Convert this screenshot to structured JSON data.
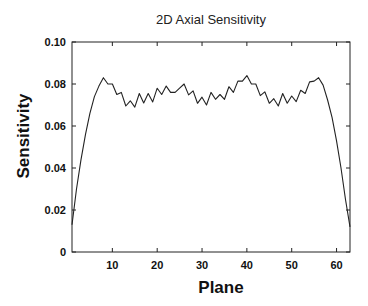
{
  "chart_data": {
    "type": "line",
    "title": "2D Axial Sensitivity",
    "xlabel": "Plane",
    "ylabel": "Sensitivity",
    "xlim": [
      1,
      63
    ],
    "ylim": [
      0,
      0.1
    ],
    "xticks": [
      10,
      20,
      30,
      40,
      50,
      60
    ],
    "xtick_labels": [
      "10",
      "20",
      "30",
      "40",
      "50",
      "60"
    ],
    "yticks": [
      0,
      0.02,
      0.04,
      0.06,
      0.08,
      0.1
    ],
    "ytick_labels": [
      "0",
      "0.02",
      "0.04",
      "0.06",
      "0.08",
      "0.10"
    ],
    "grid": false,
    "legend": null,
    "series": [
      {
        "name": "Sensitivity",
        "color": "#222222",
        "x": [
          1,
          2,
          3,
          4,
          5,
          6,
          7,
          8,
          9,
          10,
          11,
          12,
          13,
          14,
          15,
          16,
          17,
          18,
          19,
          20,
          21,
          22,
          23,
          24,
          25,
          26,
          27,
          28,
          29,
          30,
          31,
          32,
          33,
          34,
          35,
          36,
          37,
          38,
          39,
          40,
          41,
          42,
          43,
          44,
          45,
          46,
          47,
          48,
          49,
          50,
          51,
          52,
          53,
          54,
          55,
          56,
          57,
          58,
          59,
          60,
          61,
          62,
          63
        ],
        "values": [
          0.013,
          0.03,
          0.044,
          0.056,
          0.066,
          0.074,
          0.079,
          0.083,
          0.08,
          0.08,
          0.075,
          0.076,
          0.0695,
          0.072,
          0.069,
          0.0755,
          0.071,
          0.0755,
          0.0715,
          0.078,
          0.075,
          0.079,
          0.076,
          0.076,
          0.078,
          0.08,
          0.0748,
          0.0767,
          0.0708,
          0.0737,
          0.07,
          0.076,
          0.0727,
          0.075,
          0.0727,
          0.0787,
          0.076,
          0.0814,
          0.0814,
          0.084,
          0.08,
          0.08,
          0.0745,
          0.0763,
          0.0708,
          0.073,
          0.0695,
          0.0755,
          0.0708,
          0.0743,
          0.0716,
          0.077,
          0.0755,
          0.081,
          0.0814,
          0.083,
          0.0795,
          0.0724,
          0.064,
          0.053,
          0.04,
          0.025,
          0.012
        ]
      }
    ]
  }
}
